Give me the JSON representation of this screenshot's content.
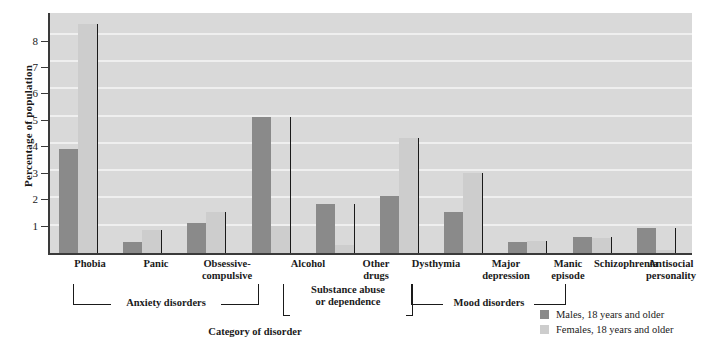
{
  "chart_data": {
    "type": "bar",
    "title": "",
    "xlabel": "Category of disorder",
    "ylabel": "Percentage of population",
    "ylim": [
      0,
      8.8
    ],
    "yticks": [
      1,
      2,
      3,
      4,
      5,
      6,
      7,
      8
    ],
    "grid": true,
    "legend_position": "bottom-right",
    "categories": [
      "Phobia",
      "Panic",
      "Obsessive-\ncompulsive",
      "Alcohol",
      "Other\ndrugs",
      "Dysthymia",
      "Major\ndepression",
      "Manic\nepisode",
      "Schizophrenia",
      "Antisocial\npersonality"
    ],
    "series": [
      {
        "name": "Males, 18 years and older",
        "color": "#8a8a8a",
        "values": [
          3.8,
          0.4,
          1.1,
          5.0,
          1.8,
          2.1,
          1.5,
          0.4,
          0.6,
          0.9
        ]
      },
      {
        "name": "Females, 18 years and older",
        "color": "#cdcdcd",
        "values": [
          8.4,
          0.85,
          1.5,
          1.0,
          0.3,
          4.2,
          2.95,
          0.45,
          0.55,
          0.1
        ]
      }
    ],
    "group_brackets": [
      {
        "label": "Anxiety disorders",
        "from": 0,
        "to": 2,
        "style": "underline"
      },
      {
        "label": "Substance abuse\nor dependence",
        "from": 3,
        "to": 4,
        "style": "boxed"
      },
      {
        "label": "Mood disorders",
        "from": 5,
        "to": 7,
        "style": "underline"
      }
    ]
  },
  "axis": {
    "y_title": "Percentage of population",
    "x_title": "Category of disorder",
    "y_ticks": [
      "8",
      "7",
      "6",
      "5",
      "4",
      "3",
      "2",
      "1"
    ]
  },
  "categories": {
    "c0": "Phobia",
    "c1": "Panic",
    "c2_line1": "Obsessive-",
    "c2_line2": "compulsive",
    "c3": "Alcohol",
    "c4_line1": "Other",
    "c4_line2": "drugs",
    "c5": "Dysthymia",
    "c6_line1": "Major",
    "c6_line2": "depression",
    "c7_line1": "Manic",
    "c7_line2": "episode",
    "c8": "Schizophrenia",
    "c9_line1": "Antisocial",
    "c9_line2": "personality"
  },
  "brackets": {
    "anxiety": "Anxiety disorders",
    "substance_line1": "Substance abuse",
    "substance_line2": "or dependence",
    "mood": "Mood disorders"
  },
  "legend": {
    "males": "Males, 18 years and older",
    "females": "Females, 18 years and older",
    "male_color": "#8a8a8a",
    "female_color": "#cdcdcd"
  }
}
